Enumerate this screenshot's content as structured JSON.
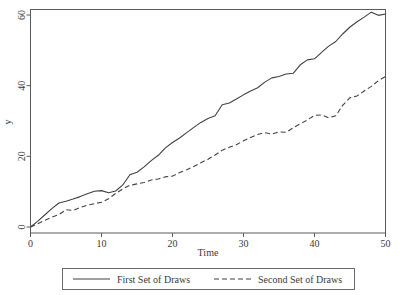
{
  "chart_data": {
    "type": "line",
    "title": "",
    "xlabel": "Time",
    "ylabel": "y",
    "xlim": [
      0,
      50
    ],
    "ylim": [
      0,
      62
    ],
    "xticks": [
      0,
      10,
      20,
      30,
      40,
      50
    ],
    "yticks": [
      0,
      20,
      40,
      60
    ],
    "grid": false,
    "legend_position": "bottom-outside",
    "x": [
      0,
      1,
      2,
      3,
      4,
      5,
      6,
      7,
      8,
      9,
      10,
      11,
      12,
      13,
      14,
      15,
      16,
      17,
      18,
      19,
      20,
      21,
      22,
      23,
      24,
      25,
      26,
      27,
      28,
      29,
      30,
      31,
      32,
      33,
      34,
      35,
      36,
      37,
      38,
      39,
      40,
      41,
      42,
      43,
      44,
      45,
      46,
      47,
      48,
      49,
      50
    ],
    "series": [
      {
        "name": "First Set of Draws",
        "style": "solid",
        "color": "#404040",
        "values": [
          0.0,
          1.6,
          3.4,
          5.2,
          6.8,
          7.3,
          7.9,
          8.6,
          9.4,
          10.1,
          10.3,
          9.7,
          10.2,
          11.9,
          14.8,
          15.5,
          17.0,
          18.8,
          20.3,
          22.4,
          23.9,
          25.2,
          26.7,
          28.2,
          29.6,
          30.7,
          31.5,
          34.6,
          35.1,
          36.2,
          37.4,
          38.5,
          39.4,
          41.0,
          42.2,
          42.6,
          43.3,
          43.5,
          45.9,
          47.3,
          47.6,
          49.4,
          51.2,
          52.5,
          54.7,
          56.6,
          58.1,
          59.4,
          60.8,
          59.9,
          60.3
        ]
      },
      {
        "name": "Second Set of Draws",
        "style": "dashed",
        "color": "#404040",
        "values": [
          0.0,
          0.9,
          1.9,
          2.8,
          3.5,
          4.9,
          4.7,
          5.5,
          6.2,
          6.6,
          7.0,
          8.0,
          9.5,
          10.8,
          11.8,
          12.2,
          12.6,
          13.3,
          13.6,
          14.2,
          14.4,
          15.4,
          16.2,
          17.1,
          18.2,
          19.2,
          20.4,
          21.7,
          22.6,
          23.3,
          24.4,
          25.3,
          26.2,
          26.7,
          26.3,
          26.9,
          26.8,
          28.1,
          29.2,
          30.3,
          31.6,
          31.7,
          30.9,
          31.5,
          34.5,
          36.6,
          37.1,
          38.5,
          39.8,
          41.4,
          42.6
        ]
      }
    ]
  },
  "legend": {
    "entries": [
      {
        "label": "First Set of Draws",
        "style": "solid"
      },
      {
        "label": "Second Set of Draws",
        "style": "dashed"
      }
    ]
  },
  "colors": {
    "background": "#ffffff",
    "axis": "#5a5a5a",
    "line": "#404040",
    "text": "#3a3a3a"
  }
}
